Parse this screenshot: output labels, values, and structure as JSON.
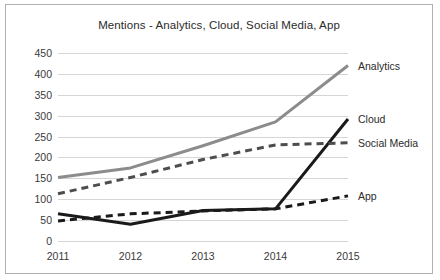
{
  "chart_data": {
    "type": "line",
    "title": "Mentions - Analytics, Cloud, Social Media, App",
    "xlabel": "",
    "ylabel": "",
    "categories": [
      "2011",
      "2012",
      "2013",
      "2014",
      "2015"
    ],
    "x": [
      2011,
      2012,
      2013,
      2014,
      2015
    ],
    "ylim": [
      0,
      450
    ],
    "ytick_labels": [
      "0",
      "50",
      "100",
      "150",
      "200",
      "250",
      "300",
      "350",
      "400",
      "450"
    ],
    "yticks": [
      0,
      50,
      100,
      150,
      200,
      250,
      300,
      350,
      400,
      450
    ],
    "grid": true,
    "legend_position": "right-inline-labels",
    "series": [
      {
        "name": "Analytics",
        "values": [
          152,
          175,
          228,
          285,
          420
        ],
        "color": "#8c8c8c",
        "style": "solid",
        "width": 3
      },
      {
        "name": "Cloud",
        "values": [
          65,
          40,
          73,
          77,
          292
        ],
        "color": "#1a1a1a",
        "style": "solid",
        "width": 3
      },
      {
        "name": "Social Media",
        "values": [
          113,
          152,
          195,
          230,
          235
        ],
        "color": "#4d4d4d",
        "style": "dashed",
        "width": 3
      },
      {
        "name": "App",
        "values": [
          48,
          65,
          72,
          77,
          108
        ],
        "color": "#1a1a1a",
        "style": "dashed",
        "width": 3
      }
    ]
  },
  "labels": {
    "analytics": "Analytics",
    "cloud": "Cloud",
    "social_media": "Social Media",
    "app": "App"
  },
  "colors": {
    "frame_border": "#b0b0b0",
    "gridline": "#d6d6d6",
    "background": "#ffffff",
    "text": "#2b2b2b"
  }
}
